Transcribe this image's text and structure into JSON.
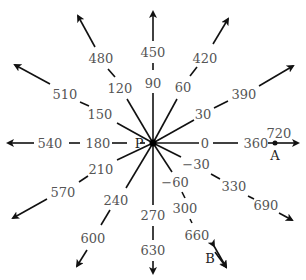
{
  "diagram": {
    "title": "Angles on a ray diagram (terminal sides)",
    "center": {
      "label": "P",
      "x": 153,
      "y": 143
    },
    "colors": {
      "ray": "#111111",
      "label": "#555555",
      "point": "#222222",
      "background": "#ffffff"
    },
    "rays": [
      {
        "angle": 0,
        "labels": [
          {
            "t": "0",
            "x": 205,
            "y": 143
          },
          {
            "t": "360",
            "x": 256,
            "y": 143
          },
          {
            "t": "720",
            "x": 279,
            "y": 133
          }
        ],
        "segments": [
          [
            153,
            143,
            199,
            143
          ],
          [
            213,
            143,
            238,
            143
          ],
          [
            268,
            143,
            296,
            143
          ]
        ],
        "tip": [
          298,
          143
        ]
      },
      {
        "angle": 30,
        "labels": [
          {
            "t": "30",
            "x": 203,
            "y": 114
          },
          {
            "t": "390",
            "x": 244,
            "y": 94
          }
        ],
        "segments": [
          [
            153,
            143,
            194,
            120
          ],
          [
            214,
            108,
            228,
            101
          ],
          [
            259,
            86,
            291,
            68
          ]
        ],
        "tip": [
          293,
          66
        ]
      },
      {
        "angle": 60,
        "labels": [
          {
            "t": "60",
            "x": 183,
            "y": 87
          },
          {
            "t": "420",
            "x": 205,
            "y": 58
          }
        ],
        "segments": [
          [
            153,
            143,
            177,
            99
          ],
          [
            190,
            76,
            197,
            67
          ],
          [
            213,
            44,
            227,
            21
          ]
        ],
        "tip": [
          228,
          19
        ]
      },
      {
        "angle": 90,
        "labels": [
          {
            "t": "90",
            "x": 153,
            "y": 83
          },
          {
            "t": "450",
            "x": 153,
            "y": 52
          }
        ],
        "segments": [
          [
            153,
            143,
            153,
            93
          ],
          [
            153,
            70,
            153,
            63
          ],
          [
            153,
            41,
            153,
            14
          ]
        ],
        "tip": [
          153,
          12
        ]
      },
      {
        "angle": 120,
        "labels": [
          {
            "t": "120",
            "x": 120,
            "y": 88
          },
          {
            "t": "480",
            "x": 101,
            "y": 58
          }
        ],
        "segments": [
          [
            153,
            143,
            127,
            99
          ],
          [
            115,
            77,
            108,
            69
          ],
          [
            95,
            47,
            80,
            19
          ]
        ],
        "tip": [
          78,
          16
        ]
      },
      {
        "angle": 150,
        "labels": [
          {
            "t": "150",
            "x": 100,
            "y": 114
          },
          {
            "t": "510",
            "x": 65,
            "y": 94
          }
        ],
        "segments": [
          [
            153,
            143,
            117,
            123
          ],
          [
            89,
            106,
            80,
            102
          ],
          [
            50,
            84,
            18,
            66
          ]
        ],
        "tip": [
          15,
          65
        ]
      },
      {
        "angle": 180,
        "labels": [
          {
            "t": "180",
            "x": 98,
            "y": 143
          },
          {
            "t": "540",
            "x": 50,
            "y": 143
          }
        ],
        "segments": [
          [
            145,
            143,
            140,
            143
          ],
          [
            127,
            143,
            112,
            143
          ],
          [
            80,
            143,
            69,
            143
          ],
          [
            34,
            143,
            10,
            143
          ]
        ],
        "tip": [
          8,
          143
        ]
      },
      {
        "angle": 210,
        "labels": [
          {
            "t": "210",
            "x": 101,
            "y": 169
          },
          {
            "t": "570",
            "x": 63,
            "y": 192
          }
        ],
        "segments": [
          [
            153,
            143,
            117,
            160
          ],
          [
            88,
            176,
            79,
            182
          ],
          [
            47,
            199,
            15,
            217
          ]
        ],
        "tip": [
          13,
          218
        ]
      },
      {
        "angle": 240,
        "labels": [
          {
            "t": "240",
            "x": 116,
            "y": 200
          },
          {
            "t": "600",
            "x": 93,
            "y": 238
          }
        ],
        "segments": [
          [
            153,
            143,
            126,
            188
          ],
          [
            110,
            210,
            101,
            225
          ],
          [
            87,
            250,
            78,
            264
          ]
        ],
        "tip": [
          77,
          266
        ]
      },
      {
        "angle": 270,
        "labels": [
          {
            "t": "270",
            "x": 153,
            "y": 215
          },
          {
            "t": "630",
            "x": 153,
            "y": 250
          }
        ],
        "segments": [
          [
            153,
            143,
            153,
            205
          ],
          [
            153,
            226,
            153,
            240
          ],
          [
            153,
            261,
            153,
            271
          ]
        ],
        "tip": [
          153,
          273
        ]
      },
      {
        "angle": -30,
        "labels": [
          {
            "t": "−30",
            "x": 196,
            "y": 164
          },
          {
            "t": "330",
            "x": 234,
            "y": 186
          },
          {
            "t": "690",
            "x": 266,
            "y": 205
          }
        ],
        "segments": [
          [
            153,
            143,
            181,
            157
          ],
          [
            211,
            174,
            220,
            179
          ],
          [
            248,
            196,
            254,
            199
          ],
          [
            279,
            213,
            290,
            219
          ]
        ],
        "tip": [
          292,
          220
        ]
      },
      {
        "angle": -60,
        "labels": [
          {
            "t": "−60",
            "x": 175,
            "y": 182
          },
          {
            "t": "300",
            "x": 185,
            "y": 208
          },
          {
            "t": "660",
            "x": 197,
            "y": 235
          }
        ],
        "segments": [
          [
            153,
            143,
            172,
            172
          ],
          [
            182,
            192,
            185,
            198
          ],
          [
            190,
            219,
            192,
            223
          ],
          [
            215,
            252,
            224,
            265
          ]
        ],
        "tip": [
          226,
          267
        ]
      }
    ],
    "points": [
      {
        "label": "A",
        "dot": [
          275,
          143
        ],
        "label_pos": [
          275,
          155
        ]
      },
      {
        "label": "B",
        "dot": null,
        "label_pos": [
          210,
          258
        ],
        "double_arrow": [
          [
            214,
            246
          ],
          [
            226,
            267
          ]
        ]
      }
    ]
  }
}
